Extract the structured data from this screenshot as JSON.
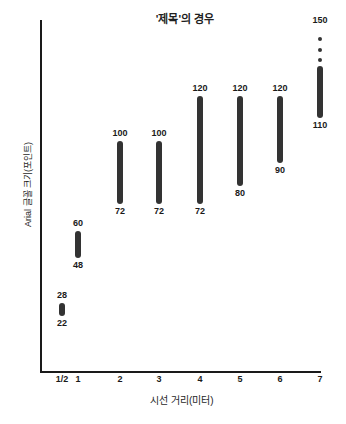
{
  "chart_data": {
    "type": "bar",
    "title": "'제목'의 경우",
    "xlabel": "시선 거리(미터)",
    "ylabel": "Arial 글꼴 크기(포인트)",
    "grid": false,
    "legend": false,
    "orientation": "vertical-range",
    "xlim": [
      0.5,
      7
    ],
    "ylim": [
      0,
      155
    ],
    "categories": [
      "1/2",
      "1",
      "2",
      "3",
      "4",
      "5",
      "6",
      "7"
    ],
    "series": [
      {
        "name": "권장 Arial 글꼴 크기 범위",
        "type": "range",
        "low": [
          22,
          48,
          72,
          72,
          72,
          80,
          90,
          110
        ],
        "high": [
          28,
          60,
          100,
          100,
          120,
          120,
          120,
          150
        ]
      }
    ],
    "points": [
      {
        "x": "1/2",
        "low": 22,
        "high": 28,
        "low_label": "22",
        "high_label": "28",
        "open_top": false
      },
      {
        "x": "1",
        "low": 48,
        "high": 60,
        "low_label": "48",
        "high_label": "60",
        "open_top": false
      },
      {
        "x": "2",
        "low": 72,
        "high": 100,
        "low_label": "72",
        "high_label": "100",
        "open_top": false
      },
      {
        "x": "3",
        "low": 72,
        "high": 100,
        "low_label": "72",
        "high_label": "100",
        "open_top": false
      },
      {
        "x": "4",
        "low": 72,
        "high": 120,
        "low_label": "72",
        "high_label": "120",
        "open_top": false
      },
      {
        "x": "5",
        "low": 80,
        "high": 120,
        "low_label": "80",
        "high_label": "120",
        "open_top": false
      },
      {
        "x": "6",
        "low": 90,
        "high": 120,
        "low_label": "90",
        "high_label": "120",
        "open_top": false
      },
      {
        "x": "7",
        "low": 110,
        "high": 150,
        "low_label": "110",
        "high_label": "150",
        "open_top": true,
        "dots": 3,
        "solid_high": 133
      }
    ],
    "colors": {
      "bar": "#333333",
      "axis": "#1a1a1a",
      "text": "#1a1a1a",
      "background": "#ffffff"
    }
  },
  "xticks": [
    {
      "label": "1/2",
      "value": 0.5
    },
    {
      "label": "1",
      "value": 1
    },
    {
      "label": "2",
      "value": 2
    },
    {
      "label": "3",
      "value": 3
    },
    {
      "label": "4",
      "value": 4
    },
    {
      "label": "5",
      "value": 5
    },
    {
      "label": "6",
      "value": 6
    },
    {
      "label": "7",
      "value": 7
    }
  ]
}
